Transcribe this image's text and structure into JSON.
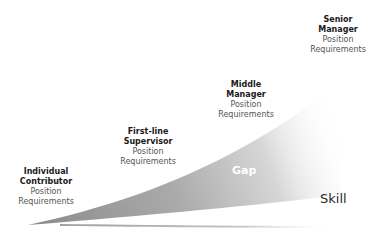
{
  "diagram": {
    "levels": [
      {
        "title_line1": "Individual",
        "title_line2": "Contributor",
        "sub_line1": "Position",
        "sub_line2": "Requirements"
      },
      {
        "title_line1": "First-line",
        "title_line2": "Supervisor",
        "sub_line1": "Position",
        "sub_line2": "Requirements"
      },
      {
        "title_line1": "Middle",
        "title_line2": "Manager",
        "sub_line1": "Position",
        "sub_line2": "Requirements"
      },
      {
        "title_line1": "Senior",
        "title_line2": "Manager",
        "sub_line1": "Position",
        "sub_line2": "Requirements"
      }
    ],
    "gap_label": "Gap",
    "skill_label": "Skill",
    "colors": {
      "gap_fill_dark": "#8f8f8f",
      "gap_fill_light": "#ffffff",
      "skill_line": "#a8a8a8",
      "title_text": "#1a1a1a",
      "sub_text": "#555555"
    }
  }
}
